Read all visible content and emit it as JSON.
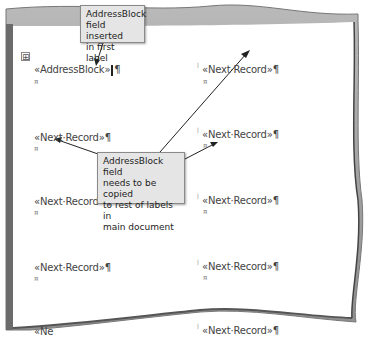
{
  "document": {
    "labels": [
      {
        "text": "«AddressBlock»",
        "pilcrow": "¶",
        "end_mark": "¤"
      },
      {
        "text": "«Next·Record»",
        "pilcrow": "¶",
        "end_mark": "¤"
      },
      {
        "text": "«Next·Record»",
        "pilcrow": "¶",
        "end_mark": "¤"
      },
      {
        "text": "«Next·Record»",
        "pilcrow": "¶",
        "end_mark": "¤"
      },
      {
        "text": "«Next·Record»",
        "pilcrow": "¶",
        "end_mark": "¤"
      },
      {
        "text": "«Next·Record»",
        "pilcrow": "¶",
        "end_mark": "¤"
      },
      {
        "text": "«Next·Record»",
        "pilcrow": "¶",
        "end_mark": "¤"
      },
      {
        "text": "«Next·Record»",
        "pilcrow": "¶",
        "end_mark": "¤"
      },
      {
        "text": "«Ne",
        "pilcrow": "",
        "end_mark": ""
      }
    ],
    "table_move_handle": "⊞",
    "column_marker": "ǀ"
  },
  "callouts": {
    "top": {
      "line1": "AddressBlock",
      "line2": "field inserted",
      "line3": "in first label"
    },
    "middle": {
      "line1": "AddressBlock field",
      "line2": "needs to be copied",
      "line3": "to rest of labels in",
      "line4": "main document"
    }
  },
  "colors": {
    "page_border": "#8c8c8c",
    "callout_bg": "#e5e5e5",
    "text": "#444444"
  }
}
